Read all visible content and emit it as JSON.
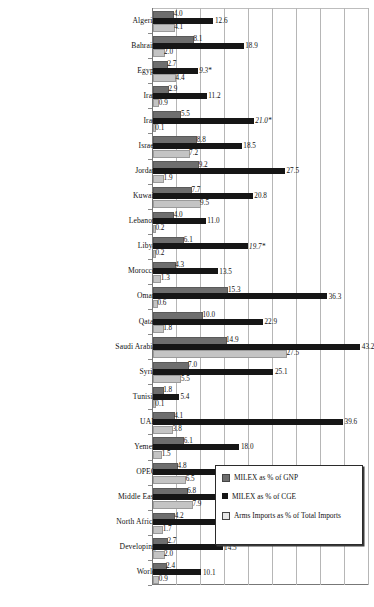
{
  "chart_data": {
    "type": "bar",
    "orientation": "horizontal",
    "title": "",
    "subtitle": "",
    "xlabel": "",
    "ylabel": "",
    "xlim": [
      0,
      45
    ],
    "xticks": [
      0,
      5,
      10,
      15,
      20,
      25,
      30,
      35,
      40,
      45
    ],
    "grid": true,
    "legend_position": "inside-bottom-right",
    "categories": [
      "Algeria",
      "Bahrain",
      "Egypt",
      "Iran",
      "Iraq",
      "Israel",
      "Jordan",
      "Kuwait",
      "Lebanon",
      "Libya",
      "Morocco",
      "Oman",
      "Qatar",
      "Saudi Arabia",
      "Syria",
      "Tunisia",
      "UAE",
      "Yemen",
      "OPEC",
      "Middle East",
      "North Africa",
      "Developing",
      "World"
    ],
    "series": [
      {
        "name": "MILEX as % of GNP",
        "color": "#6e6e6e",
        "values": [
          4.0,
          8.1,
          2.7,
          2.9,
          5.5,
          8.8,
          9.2,
          7.7,
          4.0,
          6.1,
          4.3,
          15.3,
          10.0,
          14.9,
          7.0,
          1.8,
          4.1,
          6.1,
          4.8,
          6.8,
          4.2,
          2.7,
          2.4
        ],
        "labels": [
          "4.0",
          "8.1",
          "2.7",
          "2.9",
          "5.5",
          "8.8",
          "9.2",
          "7.7",
          "4.0",
          "6.1",
          "4.3",
          "15.3",
          "10.0",
          "14.9",
          "7.0",
          "1.8",
          "4.1",
          "6.1",
          "4.8",
          "6.8",
          "4.2",
          "2.7",
          "2.4"
        ]
      },
      {
        "name": "MILEX as % of CGE",
        "color": "#161616",
        "values": [
          12.6,
          18.9,
          9.3,
          11.2,
          21.0,
          18.5,
          27.5,
          20.8,
          11.0,
          19.7,
          13.5,
          36.3,
          22.9,
          43.2,
          25.1,
          5.4,
          39.6,
          18.0,
          18.4,
          21.4,
          13.1,
          14.5,
          10.1
        ],
        "labels": [
          "12.6",
          "18.9",
          "9.3*",
          "11.2",
          "21.0*",
          "18.5",
          "27.5",
          "20.8",
          "11.0",
          "19.7*",
          "13.5",
          "36.3",
          "22.9",
          "43.2",
          "25.1",
          "5.4",
          "39.6",
          "18.0",
          "18.4",
          "21.4",
          "13.1",
          "14.5",
          "10.1"
        ],
        "estimated": [
          false,
          false,
          true,
          false,
          true,
          false,
          false,
          false,
          false,
          true,
          false,
          false,
          false,
          false,
          false,
          false,
          false,
          false,
          false,
          false,
          false,
          false,
          false
        ]
      },
      {
        "name": "Arms Imports as % of Total Imports",
        "color": "#c4c4c4",
        "values": [
          4.1,
          2.0,
          4.4,
          0.9,
          0.1,
          7.2,
          1.9,
          9.5,
          0.2,
          0.2,
          1.3,
          0.6,
          1.8,
          27.5,
          5.5,
          0.1,
          3.8,
          1.5,
          6.5,
          7.9,
          1.7,
          2.0,
          0.9
        ],
        "labels": [
          "4.1",
          "2.0",
          "4.4",
          "0.9",
          "0.1",
          "7.2",
          "1.9",
          "9.5",
          "0.2",
          "0.2",
          "1.3",
          "0.6",
          "1.8",
          "27.5",
          "5.5",
          "0.1",
          "3.8",
          "1.5",
          "6.5",
          "7.9",
          "1.7",
          "2.0",
          "0.9"
        ]
      }
    ]
  },
  "legend": {
    "items": [
      {
        "label": "MILEX as % of GNP",
        "swatch": "gnp"
      },
      {
        "label": "MILEX as % of CGE",
        "swatch": "cge"
      },
      {
        "label": "Arms Imports as % of Total Imports",
        "swatch": "arms"
      }
    ]
  },
  "colors": {
    "gnp": "#6e6e6e",
    "cge": "#161616",
    "arms": "#c4c4c4",
    "grid": "#b6b6b6",
    "axis": "#777777",
    "text": "#111111",
    "background": "#ffffff"
  }
}
